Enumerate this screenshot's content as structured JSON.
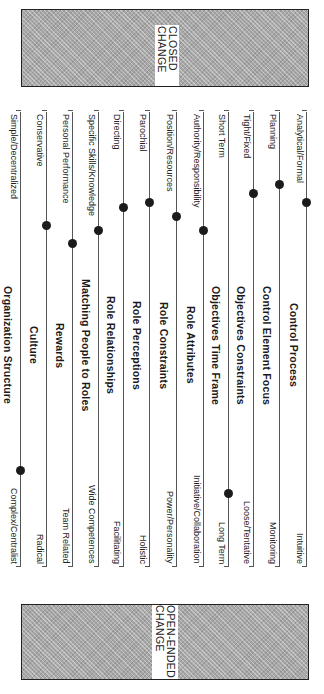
{
  "bands": {
    "top": {
      "label": "CLOSED CHANGE"
    },
    "bottom": {
      "label": "OPEN-ENDED CHANGE"
    }
  },
  "chart_data": {
    "type": "scale-profile",
    "orientation": "rotated 90° clockwise; scales run from closed change (top) to open-ended change (bottom)",
    "scales": [
      {
        "title": "Control Process",
        "left": "Analytical/Formal",
        "right": "Intuitive",
        "marker": 0.2
      },
      {
        "title": "Control Element Focus",
        "left": "Planning",
        "right": "Monitoring",
        "marker": 0.16
      },
      {
        "title": "Objectives Constraints",
        "left": "Tight/Fixed",
        "right": "Loose/Tentative",
        "marker": 0.18
      },
      {
        "title": "Objectives Time Frame",
        "left": "Short Term",
        "right": "Long Term",
        "marker": 0.84
      },
      {
        "title": "Role Attributes",
        "left": "Authority/Responsibility",
        "right": "Initiative/Collaboration",
        "marker": 0.26
      },
      {
        "title": "Role Constraints",
        "left": "Position/Resources",
        "right": "Power/Personality",
        "marker": 0.23
      },
      {
        "title": "Role Perceptions",
        "left": "Parochial",
        "right": "Holistic",
        "marker": 0.2
      },
      {
        "title": "Role Relationships",
        "left": "Directing",
        "right": "Facilitating",
        "marker": 0.21
      },
      {
        "title": "Matching People to Roles",
        "left": "Specific Skills/Knowledge",
        "right": "Wide Competences",
        "marker": 0.26
      },
      {
        "title": "Rewards",
        "left": "Personal Performance",
        "right": "Team Related",
        "marker": 0.29
      },
      {
        "title": "Culture",
        "left": "Conservative",
        "right": "Radical",
        "marker": 0.25
      },
      {
        "title": "Organization Structure",
        "left": "Simple/Decentralized",
        "right": "Complex/Centralist",
        "marker": 0.79
      }
    ]
  }
}
